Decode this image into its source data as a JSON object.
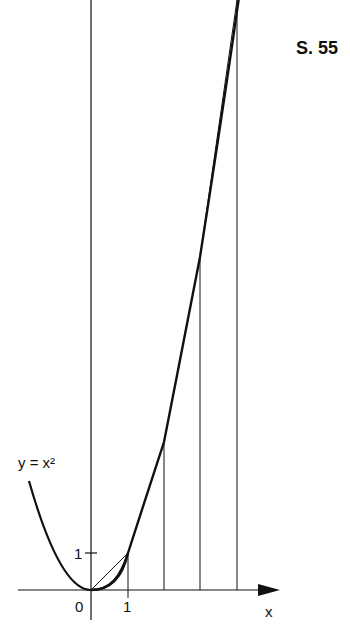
{
  "page_label": "S. 55",
  "curve_label": "y = x²",
  "axis": {
    "x_label": "x",
    "origin_label": "0",
    "x_tick_1": "1",
    "y_tick_1": "1"
  },
  "figure": {
    "function": "y = x^2",
    "x_marks": [
      1,
      2,
      3,
      4
    ],
    "chords": [
      [
        0,
        0
      ],
      [
        1,
        1
      ],
      [
        2,
        4
      ],
      [
        3,
        9
      ],
      [
        4,
        16
      ]
    ],
    "x_range": [
      -2,
      5
    ],
    "y_range": [
      0,
      16
    ]
  }
}
